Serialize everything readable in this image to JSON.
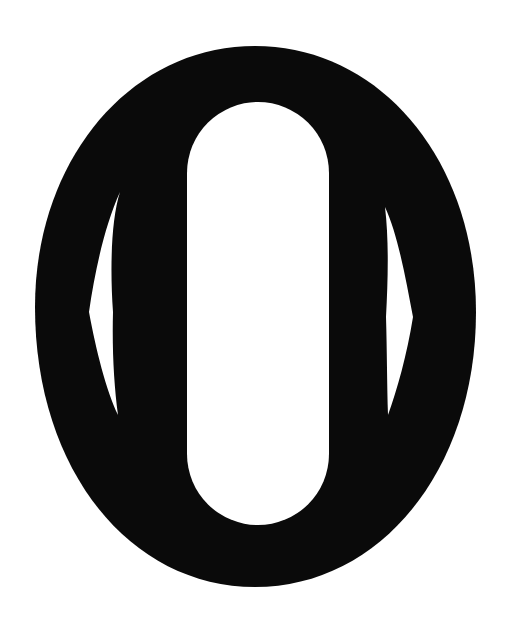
{
  "image": {
    "description": "Black oval emblem (letter O / tsuba-like shape) with central white stadium opening and two white spindle-shaped slits",
    "colors": {
      "background": "#ffffff",
      "shape": "#0a0a0a",
      "cutout": "#ffffff"
    },
    "elements": {
      "outer_shape": "black-oval",
      "center_cutout": "white-stadium",
      "left_slit": "white-spindle-left",
      "right_slit": "white-spindle-right"
    }
  }
}
